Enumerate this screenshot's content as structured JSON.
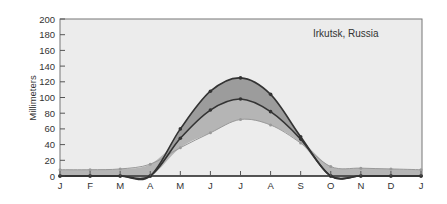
{
  "chart_data": {
    "type": "area",
    "title": "Irkutsk, Russia",
    "xlabel": "",
    "ylabel": "Millimeters",
    "ylim": [
      0,
      200
    ],
    "yticks": [
      0,
      20,
      40,
      60,
      80,
      100,
      120,
      140,
      160,
      180,
      200
    ],
    "categories": [
      "J",
      "F",
      "M",
      "A",
      "M",
      "J",
      "J",
      "A",
      "S",
      "O",
      "N",
      "D",
      "J"
    ],
    "series": [
      {
        "name": "upper",
        "values": [
          0,
          0,
          0,
          0,
          60,
          108,
          125,
          104,
          50,
          0,
          0,
          0,
          0
        ]
      },
      {
        "name": "middle",
        "values": [
          0,
          0,
          0,
          0,
          48,
          84,
          98,
          82,
          47,
          0,
          0,
          0,
          0
        ]
      },
      {
        "name": "lower",
        "values": [
          8,
          8,
          9,
          15,
          36,
          55,
          72,
          65,
          42,
          12,
          10,
          9,
          8
        ]
      }
    ],
    "grid": false,
    "legend": "none"
  },
  "colors": {
    "background": "#ececec",
    "band_dark": "#9c9c9c",
    "band_light": "#b5b5b5",
    "line": "#333333",
    "axis": "#555555"
  }
}
